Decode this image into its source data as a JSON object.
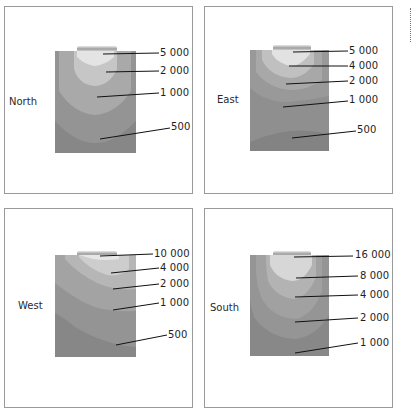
{
  "panels": [
    {
      "id": "north",
      "label": "North",
      "contours": [
        "5 000",
        "2 000",
        "1 000",
        "500"
      ]
    },
    {
      "id": "east",
      "label": "East",
      "contours": [
        "5 000",
        "4 000",
        "2 000",
        "1 000",
        "500"
      ]
    },
    {
      "id": "west",
      "label": "West",
      "contours": [
        "10 000",
        "4 000",
        "2 000",
        "1 000",
        "500"
      ]
    },
    {
      "id": "south",
      "label": "South",
      "contours": [
        "16 000",
        "8 000",
        "4 000",
        "2 000",
        "1 000"
      ]
    }
  ],
  "colors": {
    "frame": "#9a9a9a",
    "zone_darkest": "#878787",
    "zone_dark": "#959595",
    "zone_mid": "#a4a4a4",
    "zone_light": "#b9b9b9",
    "zone_lighter": "#cfcfcf",
    "zone_brightest": "#e6e6e6",
    "leader_line": "#111111"
  }
}
